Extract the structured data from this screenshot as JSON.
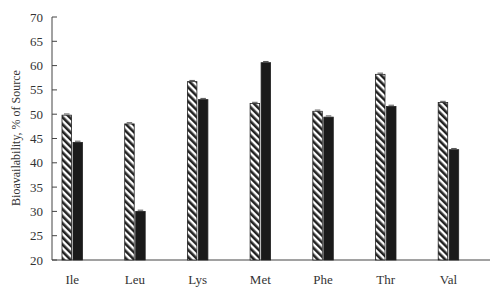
{
  "chart_data": {
    "type": "bar",
    "title": "",
    "xlabel": "",
    "ylabel": "Bioavailability, % of Source",
    "ylim": [
      20,
      70
    ],
    "yticks": [
      20,
      25,
      30,
      35,
      40,
      45,
      50,
      55,
      60,
      65,
      70
    ],
    "grid": false,
    "legend": null,
    "categories": [
      "Ile",
      "Leu",
      "Lys",
      "Met",
      "Phe",
      "Thr",
      "Val"
    ],
    "series": [
      {
        "name": "Series 1 (hatched)",
        "pattern": "diagonal-hatch",
        "values": [
          49.8,
          48.0,
          56.7,
          52.2,
          50.6,
          58.2,
          52.4
        ]
      },
      {
        "name": "Series 2 (solid)",
        "pattern": "solid",
        "color": "#1a1a1a",
        "values": [
          44.2,
          30.0,
          53.0,
          60.6,
          49.4,
          51.6,
          42.7
        ]
      }
    ]
  }
}
